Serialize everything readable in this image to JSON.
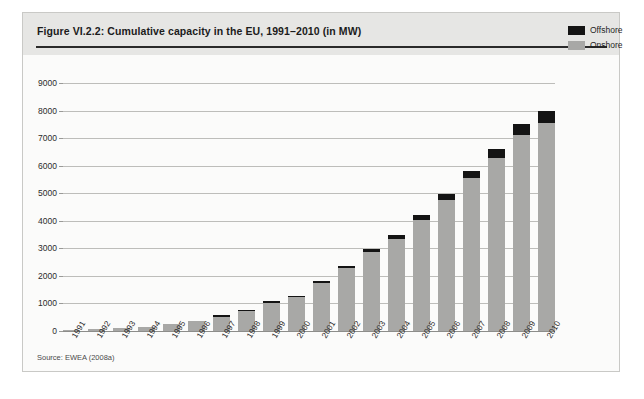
{
  "figure": {
    "title": "Figure VI.2.2: Cumulative capacity in the EU, 1991–2010 (in MW)",
    "source": "Source: EWEA (2008a)"
  },
  "legend": {
    "position": "top-right",
    "items": [
      {
        "label": "Offshore",
        "color": "#141414"
      },
      {
        "label": "Onshore",
        "color": "#a8a8a6"
      }
    ]
  },
  "axis": {
    "y_ticks": [
      "9000",
      "8000",
      "7000",
      "6000",
      "5000",
      "4000",
      "3000",
      "2000",
      "1000",
      "0"
    ]
  },
  "chart_data": {
    "type": "bar",
    "stacked": true,
    "title": "Figure VI.2.2: Cumulative capacity in the EU, 1991–2010 (in MW)",
    "xlabel": "",
    "ylabel": "",
    "ylim": [
      0,
      9000
    ],
    "ytick_step": 1000,
    "grid": true,
    "legend_position": "top-right",
    "categories": [
      "1991",
      "1992",
      "1993",
      "1994",
      "1995",
      "1996",
      "1997",
      "1998",
      "1999",
      "2000",
      "2001",
      "2002",
      "2003",
      "2004",
      "2005",
      "2006",
      "2007",
      "2008",
      "2009",
      "2010"
    ],
    "series": [
      {
        "name": "Onshore",
        "color": "#a8a8a6",
        "values": [
          50,
          70,
          110,
          160,
          250,
          370,
          520,
          720,
          1020,
          1230,
          1760,
          2280,
          2870,
          3350,
          4020,
          4750,
          5550,
          6280,
          7130,
          7550
        ]
      },
      {
        "name": "Offshore",
        "color": "#141414",
        "values": [
          0,
          0,
          0,
          0,
          0,
          0,
          10,
          20,
          30,
          40,
          60,
          90,
          120,
          150,
          180,
          220,
          270,
          320,
          390,
          450
        ]
      }
    ],
    "totals": [
      50,
      70,
      110,
      160,
      250,
      370,
      530,
      740,
      1050,
      1270,
      1820,
      2370,
      2990,
      3500,
      4200,
      4970,
      5820,
      6600,
      7520,
      8000
    ]
  }
}
